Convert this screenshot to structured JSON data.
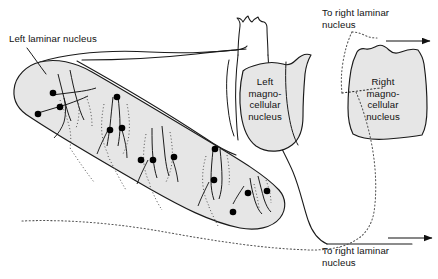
{
  "figure": {
    "background_color": "#ffffff",
    "nucleus_fill_color": "#e6e6e6",
    "outline_color": "#1a1a1a",
    "soma_color": "#000000"
  },
  "labels": {
    "left_laminar_nucleus": "Left laminar nucleus",
    "left_magnocellular_nucleus": "Left\nmagno-\ncellular\nnucleus",
    "right_magnocellular_nucleus": "Right\nmagno-\ncellular\nnucleus",
    "to_right_laminar_top": "To right laminar\nnucleus",
    "to_right_laminar_bottom": "To right laminar\nnucleus"
  },
  "structures": [
    {
      "name": "left-laminar-nucleus",
      "label": "Left laminar nucleus",
      "shaded": true
    },
    {
      "name": "left-magnocellular-nucleus",
      "label": "Left magnocellular nucleus",
      "shaded": true
    },
    {
      "name": "right-magnocellular-nucleus",
      "label": "Right magnocellular nucleus",
      "shaded": true
    },
    {
      "name": "brainstem-outline",
      "label": "Brainstem outline",
      "shaded": false
    }
  ],
  "neuron_clusters": [
    {
      "name": "neuron-cluster-1",
      "soma_count": 3
    },
    {
      "name": "neuron-cluster-2",
      "soma_count": 2
    },
    {
      "name": "neuron-cluster-3",
      "soma_count": 3
    },
    {
      "name": "neuron-cluster-4",
      "soma_count": 2
    },
    {
      "name": "neuron-cluster-5",
      "soma_count": 3
    }
  ],
  "pathways": [
    {
      "name": "commissural-tract-top",
      "style": "dotted",
      "arrow": true,
      "target": "To right laminar nucleus"
    },
    {
      "name": "commissural-tract-bottom",
      "style": "dotted",
      "arrow": true,
      "target": "To right laminar nucleus"
    }
  ]
}
